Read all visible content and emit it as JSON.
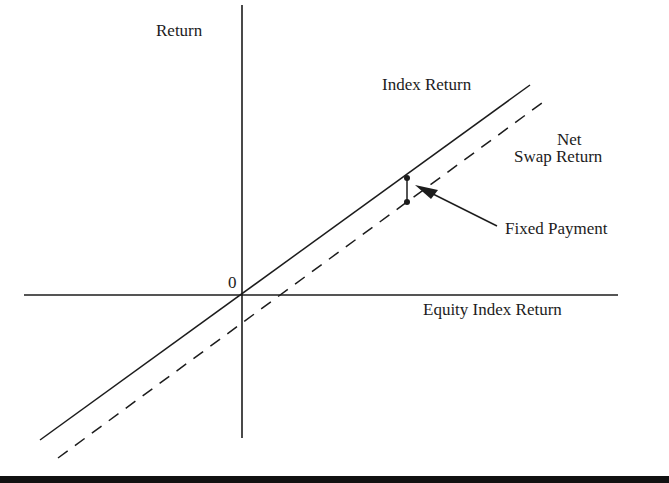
{
  "diagram": {
    "y_axis_label": "Return",
    "x_axis_label": "Equity Index Return",
    "origin_label": "0",
    "lines": [
      {
        "name": "Index Return",
        "style": "solid",
        "label": "Index Return"
      },
      {
        "name": "Net Swap Return",
        "style": "dashed",
        "label_line1": "Net",
        "label_line2": "Swap Return"
      }
    ],
    "annotation": {
      "label": "Fixed Payment",
      "description": "vertical gap between index return line and net swap return line"
    },
    "colors": {
      "line": "#1c1c1c",
      "background": "#ffffff"
    }
  }
}
